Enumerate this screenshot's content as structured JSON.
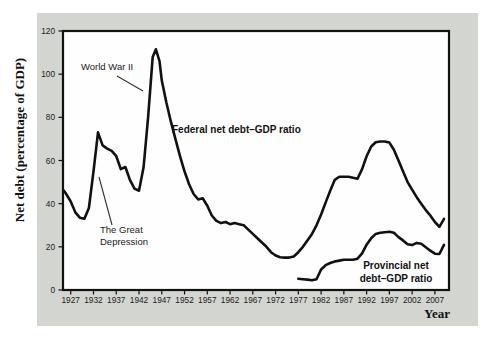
{
  "figure": {
    "background": "#ffffff",
    "card_background": "#d3d5d0",
    "line_color": "#111111"
  },
  "chart_data": {
    "type": "line",
    "xlabel": "Year",
    "ylabel": "Net debt (percentage of GDP)",
    "xlim": [
      1925.3,
      2010.1
    ],
    "ylim": [
      0,
      120
    ],
    "xticks": [
      1927,
      1932,
      1937,
      1942,
      1947,
      1952,
      1957,
      1962,
      1967,
      1972,
      1977,
      1982,
      1987,
      1992,
      1997,
      2002,
      2007
    ],
    "yticks": [
      0,
      20,
      40,
      60,
      80,
      100,
      120
    ],
    "grid": false,
    "legend": "inline-labels",
    "series": [
      {
        "id": "federal",
        "name": "Federal net debt–GDP ratio",
        "label_lines": [
          "Federal net debt–GDP ratio"
        ],
        "label_x": 172,
        "label_y": 133,
        "label_anchor": "start",
        "points": [
          [
            1925.5,
            46
          ],
          [
            1926,
            44.5
          ],
          [
            1927,
            41
          ],
          [
            1928,
            36
          ],
          [
            1929,
            33.5
          ],
          [
            1930,
            33
          ],
          [
            1931,
            38
          ],
          [
            1932,
            55
          ],
          [
            1933,
            73
          ],
          [
            1934,
            67
          ],
          [
            1935,
            65.5
          ],
          [
            1936,
            64.5
          ],
          [
            1937,
            62
          ],
          [
            1938,
            56
          ],
          [
            1939,
            57
          ],
          [
            1940,
            51
          ],
          [
            1941,
            47
          ],
          [
            1942,
            46
          ],
          [
            1943,
            57
          ],
          [
            1944,
            80
          ],
          [
            1945,
            108
          ],
          [
            1945.7,
            111.5
          ],
          [
            1946.5,
            106
          ],
          [
            1947,
            97
          ],
          [
            1948,
            87
          ],
          [
            1949,
            78
          ],
          [
            1950,
            70
          ],
          [
            1951,
            62
          ],
          [
            1952,
            55
          ],
          [
            1953,
            49
          ],
          [
            1954,
            44.5
          ],
          [
            1955,
            42
          ],
          [
            1956,
            42.5
          ],
          [
            1957,
            39
          ],
          [
            1958,
            34.5
          ],
          [
            1959,
            32
          ],
          [
            1960,
            31
          ],
          [
            1961,
            31.5
          ],
          [
            1962,
            30.5
          ],
          [
            1963,
            31
          ],
          [
            1964,
            30.5
          ],
          [
            1965,
            30
          ],
          [
            1966,
            28
          ],
          [
            1967,
            26
          ],
          [
            1968,
            24
          ],
          [
            1969,
            22
          ],
          [
            1970,
            20
          ],
          [
            1971,
            17.5
          ],
          [
            1972,
            16
          ],
          [
            1973,
            15.2
          ],
          [
            1974,
            15
          ],
          [
            1975,
            15
          ],
          [
            1976,
            15.5
          ],
          [
            1977,
            17.5
          ],
          [
            1978,
            20
          ],
          [
            1979,
            23
          ],
          [
            1980,
            26
          ],
          [
            1981,
            30
          ],
          [
            1982,
            35
          ],
          [
            1983,
            40.5
          ],
          [
            1984,
            46
          ],
          [
            1985,
            51
          ],
          [
            1986,
            52.5
          ],
          [
            1987,
            52.5
          ],
          [
            1988,
            52.5
          ],
          [
            1989,
            52
          ],
          [
            1990,
            51.5
          ],
          [
            1991,
            56
          ],
          [
            1992,
            62
          ],
          [
            1993,
            66.5
          ],
          [
            1994,
            68.5
          ],
          [
            1995,
            68.8
          ],
          [
            1996,
            68.8
          ],
          [
            1997,
            68.3
          ],
          [
            1998,
            65
          ],
          [
            1999,
            60
          ],
          [
            2000,
            55
          ],
          [
            2001,
            50
          ],
          [
            2002,
            46.5
          ],
          [
            2003,
            43
          ],
          [
            2004,
            40
          ],
          [
            2005,
            37
          ],
          [
            2006,
            34.5
          ],
          [
            2007,
            31.5
          ],
          [
            2008,
            29.3
          ],
          [
            2009,
            33
          ]
        ]
      },
      {
        "id": "provincial",
        "name": "Provincial net debt–GDP ratio",
        "label_lines": [
          "Provincial net",
          "debt–GDP ratio"
        ],
        "label_x": 396,
        "label_y": 269,
        "label_anchor": "middle",
        "points": [
          [
            1977,
            5.2
          ],
          [
            1978,
            5
          ],
          [
            1979,
            4.8
          ],
          [
            1980,
            4.5
          ],
          [
            1981,
            5
          ],
          [
            1982,
            9.5
          ],
          [
            1983,
            11.5
          ],
          [
            1984,
            12.5
          ],
          [
            1985,
            13.2
          ],
          [
            1986,
            13.6
          ],
          [
            1987,
            14
          ],
          [
            1988,
            14
          ],
          [
            1989,
            14
          ],
          [
            1990,
            14.5
          ],
          [
            1991,
            17
          ],
          [
            1992,
            21
          ],
          [
            1993,
            24
          ],
          [
            1994,
            26
          ],
          [
            1995,
            26.5
          ],
          [
            1996,
            26.8
          ],
          [
            1997,
            27
          ],
          [
            1998,
            26.5
          ],
          [
            1999,
            24.5
          ],
          [
            2000,
            23
          ],
          [
            2001,
            21.2
          ],
          [
            2002,
            20.8
          ],
          [
            2003,
            21.8
          ],
          [
            2004,
            21.4
          ],
          [
            2005,
            19.8
          ],
          [
            2006,
            18.2
          ],
          [
            2007,
            16.8
          ],
          [
            2008,
            16.7
          ],
          [
            2009,
            20.9
          ]
        ]
      }
    ],
    "annotations": [
      {
        "id": "world-war-2",
        "lines": [
          "World War II"
        ],
        "x": 81,
        "y": 70,
        "anchor": "start",
        "leader": {
          "x1": 117,
          "y1": 76,
          "x2": 143,
          "y2": 91
        }
      },
      {
        "id": "great-depression",
        "lines": [
          "The Great",
          "Depression"
        ],
        "x": 100,
        "y": 233,
        "anchor": "start",
        "leader": {
          "x1": 112,
          "y1": 225,
          "x2": 99,
          "y2": 177
        }
      }
    ]
  }
}
